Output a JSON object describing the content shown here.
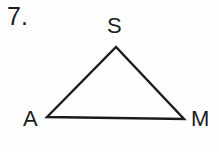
{
  "figure": {
    "problem_number": "7.",
    "shape_name": "triangle",
    "stroke_color": "#1c1c1c",
    "background_color": "#fefefe",
    "vertices": [
      {
        "id": "S",
        "label": "S",
        "role": "apex",
        "x": 116,
        "y": 47
      },
      {
        "id": "A",
        "label": "A",
        "role": "bottom-left",
        "x": 47,
        "y": 117
      },
      {
        "id": "M",
        "label": "M",
        "role": "bottom-right",
        "x": 184,
        "y": 119
      }
    ],
    "edges": [
      {
        "from": "A",
        "to": "S"
      },
      {
        "from": "S",
        "to": "M"
      },
      {
        "from": "A",
        "to": "M"
      }
    ],
    "polygon_points": "47,117 116,47 184,119",
    "stroke_width": 2.4
  }
}
